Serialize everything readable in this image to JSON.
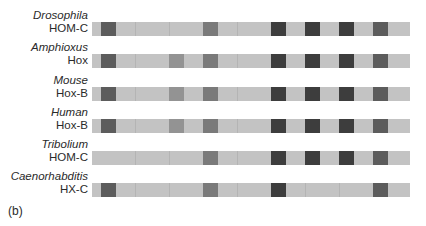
{
  "figure": {
    "panel_label": "(b)",
    "colors": {
      "bar_background": "#c3c3c3",
      "dark": "#3d3d3d",
      "medium_dark": "#5c5c5c",
      "medium": "#7a7a7a",
      "light_medium": "#939393"
    },
    "rows": [
      {
        "species": "Drosophila",
        "cluster": "HOM-C",
        "blocks": [
          {
            "x": 9,
            "shade": "medium_dark"
          },
          {
            "x": 111,
            "shade": "medium"
          },
          {
            "x": 179,
            "shade": "dark"
          },
          {
            "x": 213,
            "shade": "dark"
          },
          {
            "x": 247,
            "shade": "dark"
          },
          {
            "x": 281,
            "shade": "medium_dark"
          }
        ]
      },
      {
        "species": "Amphioxus",
        "cluster": "Hox",
        "blocks": [
          {
            "x": 9,
            "shade": "medium_dark"
          },
          {
            "x": 77,
            "shade": "light_medium"
          },
          {
            "x": 111,
            "shade": "medium"
          },
          {
            "x": 179,
            "shade": "dark"
          },
          {
            "x": 213,
            "shade": "dark"
          },
          {
            "x": 247,
            "shade": "dark"
          },
          {
            "x": 281,
            "shade": "medium_dark"
          }
        ]
      },
      {
        "species": "Mouse",
        "cluster": "Hox-B",
        "blocks": [
          {
            "x": 9,
            "shade": "medium_dark"
          },
          {
            "x": 77,
            "shade": "light_medium"
          },
          {
            "x": 111,
            "shade": "medium"
          },
          {
            "x": 179,
            "shade": "dark"
          },
          {
            "x": 213,
            "shade": "dark"
          },
          {
            "x": 247,
            "shade": "dark"
          },
          {
            "x": 281,
            "shade": "medium_dark"
          }
        ]
      },
      {
        "species": "Human",
        "cluster": "Hox-B",
        "blocks": [
          {
            "x": 9,
            "shade": "medium_dark"
          },
          {
            "x": 77,
            "shade": "light_medium"
          },
          {
            "x": 111,
            "shade": "medium"
          },
          {
            "x": 179,
            "shade": "dark"
          },
          {
            "x": 213,
            "shade": "dark"
          },
          {
            "x": 247,
            "shade": "dark"
          },
          {
            "x": 281,
            "shade": "medium_dark"
          }
        ]
      },
      {
        "species": "Tribolium",
        "cluster": "HOM-C",
        "blocks": [
          {
            "x": 111,
            "shade": "medium"
          },
          {
            "x": 179,
            "shade": "dark"
          },
          {
            "x": 213,
            "shade": "dark"
          },
          {
            "x": 247,
            "shade": "dark"
          },
          {
            "x": 281,
            "shade": "medium_dark"
          }
        ]
      },
      {
        "species": "Caenorhabditis",
        "cluster": "HX-C",
        "blocks": [
          {
            "x": 9,
            "shade": "medium_dark"
          },
          {
            "x": 111,
            "shade": "medium"
          },
          {
            "x": 179,
            "shade": "dark"
          },
          {
            "x": 281,
            "shade": "medium_dark"
          }
        ]
      }
    ]
  }
}
